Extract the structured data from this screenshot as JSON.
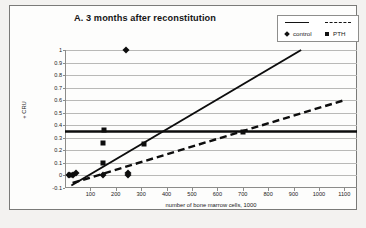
{
  "chart_data": {
    "type": "scatter",
    "title": "A. 3 months after reconstitution",
    "xlabel": "number of bone marrow cells,  1000",
    "ylabel": "+ CRU",
    "xlim": [
      0,
      1150
    ],
    "ylim": [
      -0.1,
      1.0
    ],
    "xticks": [
      100,
      200,
      300,
      400,
      500,
      600,
      700,
      800,
      900,
      1000,
      1100
    ],
    "xtick_labels": [
      "100",
      "200",
      "300",
      "400",
      "500",
      "600",
      "700",
      "800",
      "900",
      "1000",
      "1100"
    ],
    "yticks": [
      -0.1,
      0,
      0.1,
      0.2,
      0.3,
      0.4,
      0.5,
      0.6,
      0.7,
      0.8,
      0.9,
      1
    ],
    "ytick_labels": [
      "-0.1",
      "0",
      "0.1",
      "0.2",
      "0.3",
      "0.4",
      "0.5",
      "0.6",
      "0.7",
      "0.8",
      "0.9",
      "1"
    ],
    "grid": true,
    "legend_position": "top-right",
    "series": [
      {
        "name": "control",
        "marker": "diamond",
        "line_style": "solid",
        "color": "#0d0d0d",
        "points": [
          {
            "x": 15,
            "y": 0.0
          },
          {
            "x": 30,
            "y": 0.0
          },
          {
            "x": 45,
            "y": 0.02
          },
          {
            "x": 150,
            "y": 0.0
          },
          {
            "x": 240,
            "y": 1.0
          },
          {
            "x": 250,
            "y": 0.02
          },
          {
            "x": 250,
            "y": 0.0
          }
        ],
        "fit_line": {
          "x1": 25,
          "y1": -0.08,
          "x2": 930,
          "y2": 1.0
        }
      },
      {
        "name": "PTH",
        "marker": "square",
        "line_style": "dashed",
        "color": "#0d0d0d",
        "points": [
          {
            "x": 20,
            "y": 0.0
          },
          {
            "x": 150,
            "y": 0.26
          },
          {
            "x": 150,
            "y": 0.1
          },
          {
            "x": 155,
            "y": 0.36
          },
          {
            "x": 310,
            "y": 0.25
          },
          {
            "x": 700,
            "y": 0.35
          }
        ],
        "fit_line": {
          "x1": 30,
          "y1": -0.06,
          "x2": 1100,
          "y2": 0.6
        }
      },
      {
        "name": "reference-level",
        "marker": "none",
        "line_style": "solid-thick-horizontal",
        "color": "#0d0d0d",
        "level": 0.35
      }
    ]
  },
  "legend": {
    "entries": [
      {
        "label": "control",
        "marker": "diamond",
        "line": "solid"
      },
      {
        "label": "PTH",
        "marker": "square",
        "line": "dashed"
      }
    ]
  }
}
